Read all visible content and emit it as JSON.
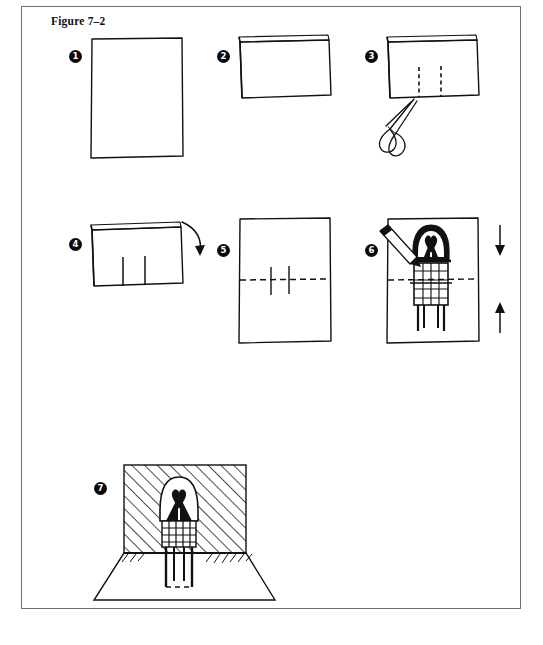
{
  "figure": {
    "title": "Figure 7–2",
    "frame_color": "#6e6e6e",
    "ink_color": "#111111",
    "background": "#ffffff"
  },
  "steps": [
    {
      "number": "1",
      "marker_x": 68,
      "marker_y": 49,
      "caption": "Start with a plain rectangular sheet of paper held in portrait orientation.",
      "elements": [
        "paper-sheet-portrait"
      ]
    },
    {
      "number": "2",
      "marker_x": 216,
      "marker_y": 49,
      "caption": "Fold the sheet in half so the fold edge is at the top.",
      "elements": [
        "folded-sheet",
        "fold-edge-top"
      ]
    },
    {
      "number": "3",
      "marker_x": 369,
      "marker_y": 49,
      "caption": "Cut two short slits up from the folded edge along the dashed lines with scissors.",
      "elements": [
        "folded-sheet",
        "dashed-cut-line-left",
        "dashed-cut-line-right",
        "scissors-icon"
      ]
    },
    {
      "number": "4",
      "marker_x": 68,
      "marker_y": 237,
      "caption": "Fold the cut tab forward along the curved arrow.",
      "elements": [
        "folded-sheet",
        "cut-tab",
        "curved-fold-arrow"
      ]
    },
    {
      "number": "5",
      "marker_x": 216,
      "marker_y": 243,
      "caption": "Open the sheet flat; the horizontal dashed fold line crosses the two vertical cuts.",
      "elements": [
        "paper-sheet-portrait",
        "dashed-fold-line-horizontal",
        "cut-line-left",
        "cut-line-right"
      ]
    },
    {
      "number": "6",
      "marker_x": 369,
      "marker_y": 243,
      "caption": "Draw the pop-up figure onto the tab, then push the tab through while closing the card.",
      "elements": [
        "paper-sheet-portrait",
        "dashed-fold-line-horizontal",
        "drawn-popup-figure",
        "pencil-icon",
        "arrow-down",
        "arrow-up"
      ]
    },
    {
      "number": "7",
      "marker_x": 93,
      "marker_y": 481,
      "caption": "Open the card — the figure stands up as a pop-up against the hatched backing panel.",
      "elements": [
        "popup-card-open",
        "hatched-back-panel",
        "base-panel",
        "standing-popup-figure",
        "shadow-line"
      ]
    }
  ],
  "annotations": {
    "arrow_down_label": "↓",
    "arrow_up_label": "↑",
    "scissors_label": "scissors",
    "pencil_label": "pencil"
  }
}
